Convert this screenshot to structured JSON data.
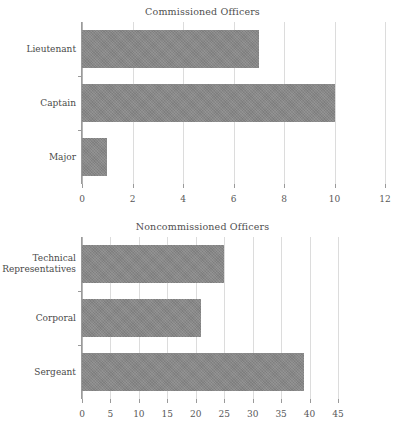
{
  "chart_data": [
    {
      "type": "bar",
      "orientation": "horizontal",
      "title": "Commissioned Officers",
      "xlabel": "",
      "ylabel": "",
      "categories": [
        "Lieutenant",
        "Captain",
        "Major"
      ],
      "values": [
        7,
        10,
        1
      ],
      "xticks": [
        0,
        2,
        4,
        6,
        8,
        10,
        12
      ],
      "xtick_labels": [
        "0",
        "2",
        "4",
        "6",
        "8",
        "10",
        "12"
      ],
      "xlim": [
        0,
        12
      ],
      "grid": true,
      "legend": "none",
      "bar_color": "#888888"
    },
    {
      "type": "bar",
      "orientation": "horizontal",
      "title": "Noncommissioned Officers",
      "xlabel": "",
      "ylabel": "",
      "categories": [
        "Technical\nRepresentatives",
        "Corporal",
        "Sergeant"
      ],
      "values": [
        25,
        21,
        39
      ],
      "xticks": [
        0,
        5,
        10,
        15,
        20,
        25,
        30,
        35,
        40,
        45
      ],
      "xtick_labels": [
        "0",
        "5",
        "10",
        "15",
        "20",
        "25",
        "30",
        "35",
        "40",
        "45"
      ],
      "xlim": [
        0,
        45
      ],
      "grid": true,
      "legend": "none",
      "bar_color": "#888888"
    }
  ]
}
